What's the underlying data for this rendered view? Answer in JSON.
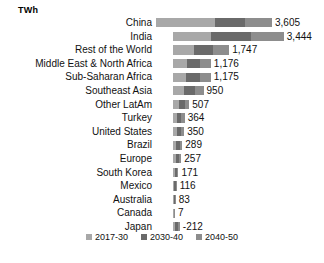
{
  "unit_title": "TWh",
  "chart_data": {
    "type": "bar",
    "orientation": "horizontal",
    "stacked": true,
    "title": "",
    "subtitle": "",
    "xlabel": "",
    "ylabel": "",
    "unit": "TWh",
    "grid": false,
    "legend_position": "bottom",
    "axis_baseline_value": 0,
    "categories": [
      "China",
      "India",
      "Rest of the World",
      "Middle East & North Africa",
      "Sub-Saharan Africa",
      "Southeast Asia",
      "Other LatAm",
      "Turkey",
      "United States",
      "Brazil",
      "Europe",
      "South Korea",
      "Mexico",
      "Australia",
      "Canada",
      "Japan"
    ],
    "series": [
      {
        "name": "2017-30",
        "color": "#a8a8a8",
        "values": [
          1820,
          1180,
          640,
          430,
          400,
          330,
          190,
          130,
          120,
          100,
          92,
          62,
          42,
          30,
          3,
          -76
        ]
      },
      {
        "name": "2030-40",
        "color": "#6a6a6a",
        "values": [
          960,
          1240,
          600,
          420,
          430,
          350,
          180,
          130,
          125,
          105,
          90,
          60,
          40,
          28,
          2,
          -74
        ]
      },
      {
        "name": "2040-50",
        "color": "#8d8d8d",
        "values": [
          825,
          1024,
          507,
          326,
          345,
          270,
          137,
          104,
          105,
          84,
          75,
          49,
          34,
          25,
          2,
          -62
        ]
      }
    ],
    "totals": [
      3605,
      3444,
      1747,
      1176,
      1175,
      950,
      507,
      364,
      350,
      289,
      257,
      171,
      116,
      83,
      7,
      -212
    ],
    "value_labels": [
      "3,605",
      "3,444",
      "1,747",
      "1,176",
      "1,175",
      "950",
      "507",
      "364",
      "350",
      "289",
      "257",
      "171",
      "116",
      "83",
      "7",
      "-212"
    ]
  },
  "legend": {
    "items": [
      {
        "label": "2017-30",
        "color": "#a8a8a8"
      },
      {
        "label": "2030-40",
        "color": "#6a6a6a"
      },
      {
        "label": "2040-50",
        "color": "#8d8d8d"
      }
    ]
  },
  "colors": {
    "background": "#ffffff",
    "text": "#111111",
    "series_2017_30": "#a8a8a8",
    "series_2030_40": "#6a6a6a",
    "series_2040_50": "#8d8d8d"
  }
}
